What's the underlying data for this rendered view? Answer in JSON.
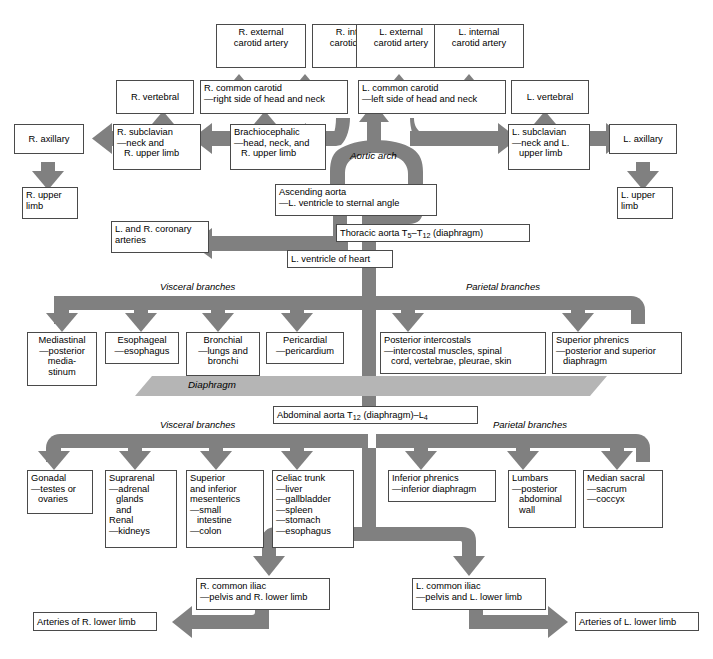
{
  "diagram": {
    "colors": {
      "vessel": "#808080",
      "diaphragm": "#b5b5b5",
      "box_border": "#4a4a4a",
      "text": "#000000",
      "background": "#ffffff"
    },
    "labels": {
      "aortic_arch": "Aortic arch",
      "diaphragm": "Diaphragm",
      "visceral_thoracic": "Visceral branches",
      "parietal_thoracic": "Parietal branches",
      "visceral_abdominal": "Visceral branches",
      "parietal_abdominal": "Parietal branches"
    },
    "nodes": {
      "r_external_carotid": {
        "title": "R. external",
        "lines": [
          "carotid artery"
        ]
      },
      "r_internal_carotid": {
        "title": "R. internal",
        "lines": [
          "carotid artery"
        ]
      },
      "l_external_carotid": {
        "title": "L. external",
        "lines": [
          "carotid artery"
        ]
      },
      "l_internal_carotid": {
        "title": "L. internal",
        "lines": [
          "carotid artery"
        ]
      },
      "r_vertebral": {
        "title": "R. vertebral",
        "lines": []
      },
      "l_vertebral": {
        "title": "L. vertebral",
        "lines": []
      },
      "r_common_carotid": {
        "title": "R. common carotid",
        "lines": [
          "—right side of head and neck"
        ]
      },
      "l_common_carotid": {
        "title": "L. common carotid",
        "lines": [
          "—left side of head and neck"
        ]
      },
      "r_axillary": {
        "title": "R. axillary",
        "lines": []
      },
      "l_axillary": {
        "title": "L. axillary",
        "lines": []
      },
      "r_subclavian": {
        "title": "R. subclavian",
        "lines": [
          "—neck and",
          "R. upper limb"
        ]
      },
      "l_subclavian": {
        "title": "L. subclavian",
        "lines": [
          "—neck and L.",
          "upper limb"
        ]
      },
      "brachiocephalic": {
        "title": "Brachiocephalic",
        "lines": [
          "—head, neck, and",
          "R. upper limb"
        ]
      },
      "r_upper_limb": {
        "title": "R. upper",
        "lines": [
          "limb"
        ]
      },
      "l_upper_limb": {
        "title": "L. upper",
        "lines": [
          "limb"
        ]
      },
      "ascending_aorta": {
        "title": "Ascending aorta",
        "lines": [
          "—L. ventricle to sternal angle"
        ]
      },
      "thoracic_aorta": {
        "title": "Thoracic aorta T5–T12 (diaphragm)",
        "lines": []
      },
      "coronary_arteries": {
        "title": "L. and R. coronary",
        "lines": [
          "arteries"
        ]
      },
      "l_ventricle": {
        "title": "L. ventricle of heart",
        "lines": []
      },
      "mediastinal": {
        "title": "Mediastinal",
        "lines": [
          "—posterior",
          "media-",
          "stinum"
        ]
      },
      "esophageal": {
        "title": "Esophageal",
        "lines": [
          "—esophagus"
        ]
      },
      "bronchial": {
        "title": "Bronchial",
        "lines": [
          "—lungs and",
          "bronchi"
        ]
      },
      "pericardial": {
        "title": "Pericardial",
        "lines": [
          "—pericardium"
        ]
      },
      "posterior_intercostals": {
        "title": "Posterior intercostals",
        "lines": [
          "—intercostal muscles, spinal",
          "cord, vertebrae, pleurae, skin"
        ]
      },
      "superior_phrenics": {
        "title": "Superior phrenics",
        "lines": [
          "—posterior and superior",
          "diaphragm"
        ]
      },
      "abdominal_aorta": {
        "title": "Abdominal aorta T12 (diaphragm)–L4",
        "lines": []
      },
      "gonadal": {
        "title": "Gonadal",
        "lines": [
          "—testes or",
          "ovaries"
        ]
      },
      "suprarenal": {
        "title": "Suprarenal",
        "lines": [
          "—adrenal",
          "glands",
          "and",
          "Renal",
          "—kidneys"
        ]
      },
      "mesenterics": {
        "title": "Superior",
        "lines": [
          "and inferior",
          "mesenterics",
          "—small",
          "intestine",
          "—colon"
        ]
      },
      "celiac_trunk": {
        "title": "Celiac trunk",
        "lines": [
          "—liver",
          "—gallbladder",
          "—spleen",
          "—stomach",
          "—esophagus"
        ]
      },
      "inferior_phrenics": {
        "title": "Inferior phrenics",
        "lines": [
          "—inferior diaphragm"
        ]
      },
      "lumbars": {
        "title": "Lumbars",
        "lines": [
          "—posterior",
          "abdominal",
          "wall"
        ]
      },
      "median_sacral": {
        "title": "Median sacral",
        "lines": [
          "—sacrum",
          "—coccyx"
        ]
      },
      "r_common_iliac": {
        "title": "R. common iliac",
        "lines": [
          "—pelvis and R. lower limb"
        ]
      },
      "l_common_iliac": {
        "title": "L. common iliac",
        "lines": [
          "—pelvis and L. lower limb"
        ]
      },
      "r_lower_limb_arteries": {
        "title": "Arteries of R. lower limb",
        "lines": []
      },
      "l_lower_limb_arteries": {
        "title": "Arteries of L. lower limb",
        "lines": []
      }
    }
  }
}
